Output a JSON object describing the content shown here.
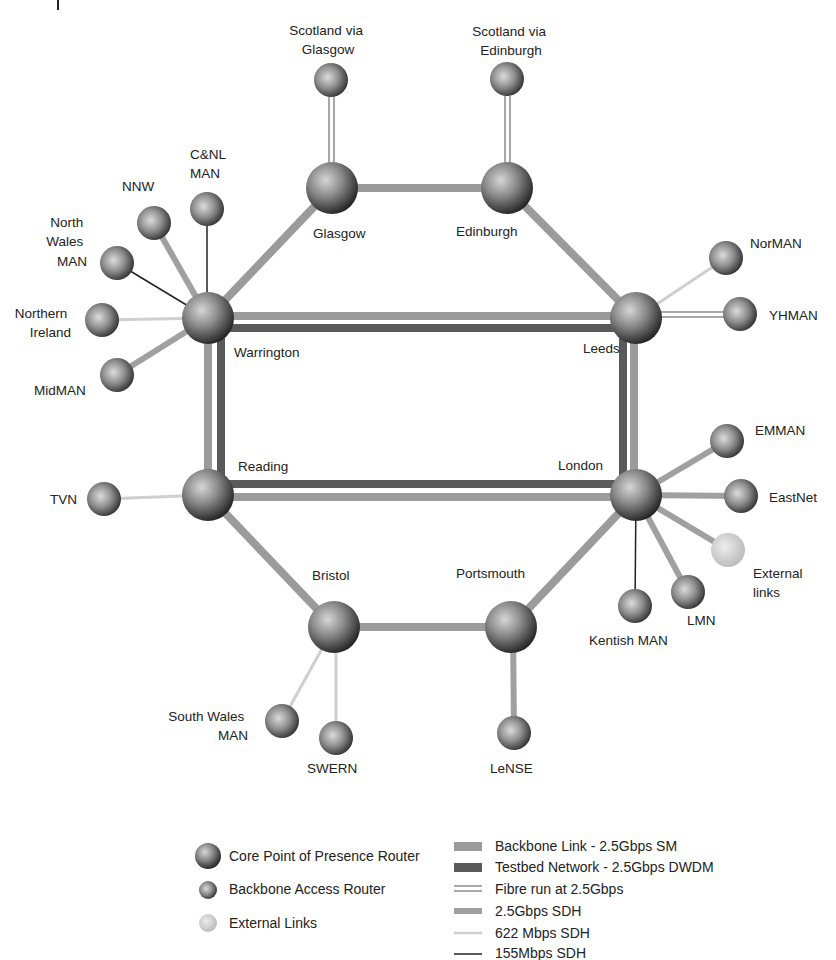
{
  "title": "",
  "colors": {
    "backbone_sm": "#9b9b9b",
    "testbed_dwdm": "#5a5a5a",
    "fibre": "#a8a8a8",
    "sdh_2_5": "#a0a0a0",
    "sdh_622": "#cfcfcf",
    "sdh_155": "#222222",
    "core_router": "#555555",
    "access_router": "#5e5e5e",
    "external": "#c8c8c8"
  },
  "nodes": {
    "core": [
      {
        "id": "glasgow",
        "label": "Glasgow",
        "x": 332,
        "y": 188
      },
      {
        "id": "edinburgh",
        "label": "Edinburgh",
        "x": 507,
        "y": 188
      },
      {
        "id": "warrington",
        "label": "Warrington",
        "x": 208,
        "y": 318
      },
      {
        "id": "leeds",
        "label": "Leeds",
        "x": 636,
        "y": 318
      },
      {
        "id": "reading",
        "label": "Reading",
        "x": 208,
        "y": 495
      },
      {
        "id": "london",
        "label": "London",
        "x": 636,
        "y": 495
      },
      {
        "id": "bristol",
        "label": "Bristol",
        "x": 334,
        "y": 627
      },
      {
        "id": "portsmouth",
        "label": "Portsmouth",
        "x": 511,
        "y": 627
      }
    ],
    "access": [
      {
        "id": "scot_glasgow",
        "label_lines": [
          "Scotland via",
          "Glasgow"
        ],
        "x": 331,
        "y": 80
      },
      {
        "id": "scot_edinburgh",
        "label_lines": [
          "Scotland via",
          "Edinburgh"
        ],
        "x": 507,
        "y": 79
      },
      {
        "id": "nnw",
        "label_lines": [
          "NNW"
        ],
        "x": 154,
        "y": 223
      },
      {
        "id": "cnl_man",
        "label_lines": [
          "C&NL",
          "MAN"
        ],
        "x": 207,
        "y": 209
      },
      {
        "id": "north_wales_man",
        "label_lines": [
          "North",
          "Wales",
          "MAN"
        ],
        "x": 117,
        "y": 263
      },
      {
        "id": "northern_ireland",
        "label_lines": [
          "Northern",
          "Ireland"
        ],
        "x": 102,
        "y": 320
      },
      {
        "id": "midman",
        "label_lines": [
          "MidMAN"
        ],
        "x": 117,
        "y": 375
      },
      {
        "id": "norman",
        "label_lines": [
          "NorMAN"
        ],
        "x": 726,
        "y": 258
      },
      {
        "id": "yhman",
        "label_lines": [
          "YHMAN"
        ],
        "x": 740,
        "y": 314
      },
      {
        "id": "tvn",
        "label_lines": [
          "TVN"
        ],
        "x": 104,
        "y": 499
      },
      {
        "id": "emman",
        "label_lines": [
          "EMMAN"
        ],
        "x": 727,
        "y": 441
      },
      {
        "id": "eastnet",
        "label_lines": [
          "EastNet"
        ],
        "x": 741,
        "y": 496
      },
      {
        "id": "lmn",
        "label_lines": [
          "LMN"
        ],
        "x": 688,
        "y": 592
      },
      {
        "id": "kentish_man",
        "label_lines": [
          "Kentish MAN"
        ],
        "x": 635,
        "y": 606
      },
      {
        "id": "south_wales_man",
        "label_lines": [
          "South Wales",
          "MAN"
        ],
        "x": 282,
        "y": 721
      },
      {
        "id": "swern",
        "label_lines": [
          "SWERN"
        ],
        "x": 336,
        "y": 738
      },
      {
        "id": "lense",
        "label_lines": [
          "LeNSE"
        ],
        "x": 514,
        "y": 733
      }
    ],
    "external": [
      {
        "id": "external_links",
        "label_lines": [
          "External",
          "links"
        ],
        "x": 728,
        "y": 550
      }
    ]
  },
  "links": [
    {
      "from": "glasgow",
      "to": "edinburgh",
      "type": "backbone_sm"
    },
    {
      "from": "edinburgh",
      "to": "leeds",
      "type": "backbone_sm"
    },
    {
      "from": "glasgow",
      "to": "warrington",
      "type": "backbone_sm"
    },
    {
      "from": "warrington",
      "to": "leeds",
      "type": "backbone_sm+testbed"
    },
    {
      "from": "warrington",
      "to": "reading",
      "type": "backbone_sm+testbed"
    },
    {
      "from": "leeds",
      "to": "london",
      "type": "backbone_sm+testbed"
    },
    {
      "from": "reading",
      "to": "london",
      "type": "backbone_sm+testbed"
    },
    {
      "from": "reading",
      "to": "bristol",
      "type": "backbone_sm"
    },
    {
      "from": "bristol",
      "to": "portsmouth",
      "type": "backbone_sm"
    },
    {
      "from": "portsmouth",
      "to": "london",
      "type": "backbone_sm"
    },
    {
      "from": "glasgow",
      "to": "scot_glasgow",
      "type": "fibre"
    },
    {
      "from": "edinburgh",
      "to": "scot_edinburgh",
      "type": "fibre"
    },
    {
      "from": "leeds",
      "to": "yhman",
      "type": "fibre"
    },
    {
      "from": "leeds",
      "to": "norman",
      "type": "sdh_622"
    },
    {
      "from": "warrington",
      "to": "nnw",
      "type": "sdh_2_5"
    },
    {
      "from": "warrington",
      "to": "cnl_man",
      "type": "sdh_155"
    },
    {
      "from": "warrington",
      "to": "north_wales_man",
      "type": "sdh_155"
    },
    {
      "from": "warrington",
      "to": "northern_ireland",
      "type": "sdh_622"
    },
    {
      "from": "warrington",
      "to": "midman",
      "type": "sdh_2_5"
    },
    {
      "from": "reading",
      "to": "tvn",
      "type": "sdh_622"
    },
    {
      "from": "london",
      "to": "emman",
      "type": "sdh_2_5"
    },
    {
      "from": "london",
      "to": "eastnet",
      "type": "sdh_2_5"
    },
    {
      "from": "london",
      "to": "external_links",
      "type": "sdh_2_5"
    },
    {
      "from": "london",
      "to": "lmn",
      "type": "sdh_2_5"
    },
    {
      "from": "london",
      "to": "kentish_man",
      "type": "sdh_155"
    },
    {
      "from": "bristol",
      "to": "south_wales_man",
      "type": "sdh_622"
    },
    {
      "from": "bristol",
      "to": "swern",
      "type": "sdh_622"
    },
    {
      "from": "portsmouth",
      "to": "lense",
      "type": "sdh_2_5"
    }
  ],
  "legend": {
    "nodes": [
      {
        "label": "Core Point of Presence Router"
      },
      {
        "label": "Backbone Access Router"
      },
      {
        "label": "External Links"
      }
    ],
    "links": [
      {
        "label": "Backbone Link - 2.5Gbps SM"
      },
      {
        "label": "Testbed Network - 2.5Gbps DWDM"
      },
      {
        "label": "Fibre run at 2.5Gbps"
      },
      {
        "label": "2.5Gbps SDH"
      },
      {
        "label": "622 Mbps SDH"
      },
      {
        "label": "155Mbps SDH"
      }
    ]
  }
}
